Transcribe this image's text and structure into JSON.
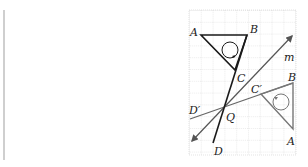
{
  "diagram": {
    "type": "geometry-reflection",
    "grid": {
      "x": 189,
      "y": 10,
      "width": 107,
      "height": 145,
      "cell": 11.8,
      "line_color": "#c8c8c8"
    },
    "colors": {
      "original": "#1a1a1a",
      "image": "#6e6e6e",
      "line": "#555555"
    },
    "labels": {
      "A_top": "A",
      "B_top": "B",
      "C_top": "C",
      "m": "m",
      "B_right": "B",
      "C_prime": "C′",
      "D_prime": "D′",
      "Q": "Q",
      "A_right": "A",
      "D": "D"
    },
    "points": {
      "A": [
        201,
        35
      ],
      "B": [
        247,
        35
      ],
      "C": [
        235,
        70
      ],
      "Q": [
        224,
        108
      ],
      "D": [
        213,
        143
      ],
      "B2": [
        293,
        83
      ],
      "C2": [
        261,
        94
      ],
      "A2": [
        293,
        129
      ],
      "m_start": [
        192,
        141
      ],
      "m_end": [
        292,
        36
      ],
      "dp_start": [
        190,
        119
      ],
      "dp_end": [
        293,
        83
      ]
    }
  }
}
